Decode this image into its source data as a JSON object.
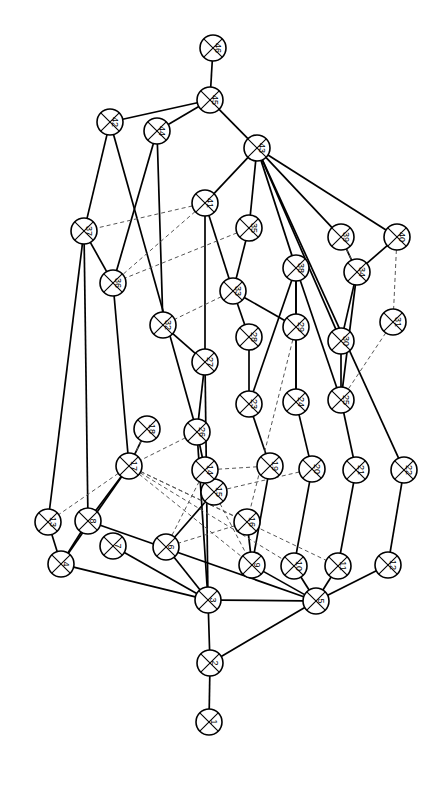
{
  "figure": {
    "type": "graph-diagram",
    "title": "",
    "background": "#ffffff",
    "width": 441,
    "height": 786,
    "node_style": {
      "shape": "circle-with-x",
      "fill": "#ffffff",
      "stroke": "#000000",
      "radius": 13,
      "label_rotation_deg": 90
    },
    "edge_styles": {
      "solid": {
        "color": "#000000",
        "width": 1.7
      },
      "dashed": {
        "color": "#555555",
        "width": 1.0,
        "dash": "4 3"
      }
    }
  },
  "chart_data": {
    "type": "graph",
    "title": "",
    "node_count": 46,
    "nodes": [
      {
        "id": 46,
        "label": "46",
        "x": 213,
        "y": 48
      },
      {
        "id": 45,
        "label": "45",
        "x": 210,
        "y": 100
      },
      {
        "id": 44,
        "label": "44",
        "x": 157,
        "y": 131
      },
      {
        "id": 43,
        "label": "43",
        "x": 257,
        "y": 148
      },
      {
        "id": 42,
        "label": "42",
        "x": 110,
        "y": 122
      },
      {
        "id": 41,
        "label": "41",
        "x": 205,
        "y": 203
      },
      {
        "id": 40,
        "label": "40",
        "x": 397,
        "y": 237
      },
      {
        "id": 39,
        "label": "39",
        "x": 341,
        "y": 237
      },
      {
        "id": 38,
        "label": "38",
        "x": 296,
        "y": 268
      },
      {
        "id": 37,
        "label": "37",
        "x": 84,
        "y": 231
      },
      {
        "id": 36,
        "label": "36",
        "x": 113,
        "y": 283
      },
      {
        "id": 35,
        "label": "35",
        "x": 249,
        "y": 228
      },
      {
        "id": 34,
        "label": "34",
        "x": 357,
        "y": 272
      },
      {
        "id": 33,
        "label": "33",
        "x": 233,
        "y": 291
      },
      {
        "id": 32,
        "label": "32",
        "x": 163,
        "y": 325
      },
      {
        "id": 31,
        "label": "31",
        "x": 393,
        "y": 322
      },
      {
        "id": 30,
        "label": "30",
        "x": 341,
        "y": 341
      },
      {
        "id": 29,
        "label": "29",
        "x": 296,
        "y": 327
      },
      {
        "id": 28,
        "label": "28",
        "x": 249,
        "y": 337
      },
      {
        "id": 27,
        "label": "27",
        "x": 205,
        "y": 362
      },
      {
        "id": 26,
        "label": "26",
        "x": 197,
        "y": 432
      },
      {
        "id": 25,
        "label": "25",
        "x": 341,
        "y": 400
      },
      {
        "id": 24,
        "label": "24",
        "x": 296,
        "y": 402
      },
      {
        "id": 23,
        "label": "23",
        "x": 249,
        "y": 404
      },
      {
        "id": 22,
        "label": "22",
        "x": 404,
        "y": 470
      },
      {
        "id": 21,
        "label": "21",
        "x": 356,
        "y": 470
      },
      {
        "id": 20,
        "label": "20",
        "x": 312,
        "y": 469
      },
      {
        "id": 19,
        "label": "19",
        "x": 270,
        "y": 466
      },
      {
        "id": 18,
        "label": "18",
        "x": 147,
        "y": 429
      },
      {
        "id": 17,
        "label": "17",
        "x": 129,
        "y": 466
      },
      {
        "id": 16,
        "label": "16",
        "x": 247,
        "y": 522
      },
      {
        "id": 15,
        "label": "15",
        "x": 214,
        "y": 492
      },
      {
        "id": 14,
        "label": "14",
        "x": 205,
        "y": 470
      },
      {
        "id": 13,
        "label": "13",
        "x": 48,
        "y": 522
      },
      {
        "id": 12,
        "label": "12",
        "x": 388,
        "y": 565
      },
      {
        "id": 11,
        "label": "11",
        "x": 338,
        "y": 566
      },
      {
        "id": 10,
        "label": "10",
        "x": 294,
        "y": 566
      },
      {
        "id": 9,
        "label": "9",
        "x": 252,
        "y": 565
      },
      {
        "id": 8,
        "label": "8",
        "x": 88,
        "y": 521
      },
      {
        "id": 7,
        "label": "7",
        "x": 113,
        "y": 546
      },
      {
        "id": 6,
        "label": "6",
        "x": 166,
        "y": 547
      },
      {
        "id": 5,
        "label": "5",
        "x": 316,
        "y": 601
      },
      {
        "id": 4,
        "label": "4",
        "x": 61,
        "y": 564
      },
      {
        "id": 3,
        "label": "3",
        "x": 208,
        "y": 600
      },
      {
        "id": 2,
        "label": "2",
        "x": 210,
        "y": 663
      },
      {
        "id": 1,
        "label": "1",
        "x": 209,
        "y": 722
      }
    ],
    "edges_solid": [
      [
        46,
        45
      ],
      [
        45,
        42
      ],
      [
        45,
        44
      ],
      [
        45,
        43
      ],
      [
        42,
        37
      ],
      [
        44,
        36
      ],
      [
        43,
        41
      ],
      [
        43,
        35
      ],
      [
        43,
        38
      ],
      [
        43,
        39
      ],
      [
        43,
        40
      ],
      [
        43,
        30
      ],
      [
        41,
        27
      ],
      [
        41,
        33
      ],
      [
        37,
        36
      ],
      [
        37,
        13
      ],
      [
        36,
        17
      ],
      [
        35,
        33
      ],
      [
        33,
        28
      ],
      [
        33,
        29
      ],
      [
        38,
        29
      ],
      [
        38,
        24
      ],
      [
        38,
        23
      ],
      [
        38,
        25
      ],
      [
        39,
        34
      ],
      [
        40,
        34
      ],
      [
        34,
        30
      ],
      [
        34,
        25
      ],
      [
        28,
        23
      ],
      [
        29,
        24
      ],
      [
        30,
        25
      ],
      [
        23,
        19
      ],
      [
        24,
        20
      ],
      [
        25,
        21
      ],
      [
        19,
        9
      ],
      [
        20,
        10
      ],
      [
        21,
        11
      ],
      [
        22,
        12
      ],
      [
        32,
        27
      ],
      [
        27,
        26
      ],
      [
        26,
        14
      ],
      [
        18,
        17
      ],
      [
        17,
        8
      ],
      [
        17,
        4
      ],
      [
        13,
        4
      ],
      [
        8,
        4
      ],
      [
        8,
        5
      ],
      [
        14,
        15
      ],
      [
        15,
        6
      ],
      [
        16,
        9
      ],
      [
        9,
        5
      ],
      [
        10,
        5
      ],
      [
        11,
        5
      ],
      [
        12,
        5
      ],
      [
        4,
        3
      ],
      [
        6,
        3
      ],
      [
        7,
        3
      ],
      [
        3,
        2
      ],
      [
        5,
        2
      ],
      [
        2,
        1
      ],
      [
        42,
        26
      ],
      [
        44,
        32
      ],
      [
        43,
        22
      ],
      [
        37,
        8
      ],
      [
        26,
        3
      ],
      [
        27,
        3
      ],
      [
        5,
        3
      ]
    ],
    "edges_dashed": [
      [
        41,
        37
      ],
      [
        41,
        36
      ],
      [
        35,
        36
      ],
      [
        33,
        32
      ],
      [
        40,
        31
      ],
      [
        39,
        34
      ],
      [
        31,
        25
      ],
      [
        26,
        17
      ],
      [
        18,
        17
      ],
      [
        17,
        13
      ],
      [
        17,
        16
      ],
      [
        17,
        9
      ],
      [
        17,
        10
      ],
      [
        17,
        11
      ],
      [
        19,
        14
      ],
      [
        20,
        15
      ],
      [
        29,
        16
      ],
      [
        16,
        6
      ],
      [
        14,
        6
      ],
      [
        15,
        9
      ]
    ],
    "legend": [],
    "annotations": []
  }
}
